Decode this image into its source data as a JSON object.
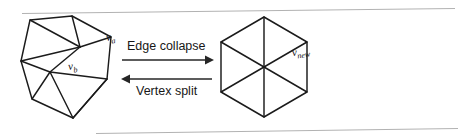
{
  "figure": {
    "background_color": "#ffffff",
    "stroke_color": "#1b1b1b",
    "rule_color": "#b2b2b2",
    "width": 472,
    "height": 137
  },
  "rules": {
    "top": {
      "x1": 22,
      "y1": 13.5,
      "x2": 455,
      "y2": 8.5
    },
    "bottom": {
      "x1": 96,
      "y1": 133.5,
      "x2": 458,
      "y2": 128.5
    }
  },
  "left_mesh": {
    "name": "pre-collapse-mesh",
    "caption_a": "v",
    "caption_a_sub": "a",
    "caption_b": "v",
    "caption_b_sub": "b",
    "label_a_position": {
      "x": 82,
      "y": 44
    },
    "label_b_position": {
      "x": 44,
      "y": 77
    },
    "boundary": "30,20 72,16 111,37 107,79 73,118 32,99 21,61",
    "edges": [
      "M 30,20 L 72,16",
      "M 72,16 L 111,37",
      "M 111,37 L 107,79",
      "M 107,79 L 73,118",
      "M 73,118 L 32,99",
      "M 32,99 L 21,61",
      "M 21,61 L 30,20",
      "M 30,20 L 80,47",
      "M 72,16 L 80,47",
      "M 111,37 L 80,47",
      "M 21,61 L 80,47",
      "M 21,61 L 50,72",
      "M 80,47 L 50,72",
      "M 107,79 L 50,72",
      "M 32,99 L 50,72",
      "M 73,118 L 50,72",
      "M 73,118 L 107,79",
      "M 107,79 L 111,37"
    ],
    "collapse_edge": "M 80,47 L 50,72"
  },
  "right_mesh": {
    "name": "post-collapse-mesh",
    "caption_new": "v",
    "caption_new_sub": "new",
    "label_new_position": {
      "x": 268,
      "y": 62
    },
    "center": {
      "x": 264,
      "y": 67
    },
    "vertices": "264,17 307,42 307,92 264,117 221,92 221,42",
    "edges": [
      "M 264,17 L 307,42",
      "M 307,42 L 307,92",
      "M 307,92 L 264,117",
      "M 264,117 L 221,92",
      "M 221,92 L 221,42",
      "M 221,42 L 264,17",
      "M 264,67 L 264,17",
      "M 264,67 L 307,42",
      "M 264,67 L 307,92",
      "M 264,67 L 264,117",
      "M 264,67 L 221,92",
      "M 264,67 L 221,42"
    ]
  },
  "arrows": {
    "forward": {
      "label": "Edge collapse",
      "label_position": {
        "x": 127,
        "y": 50
      },
      "line": {
        "x1": 122,
        "y1": 60,
        "x2": 210,
        "y2": 60
      },
      "direction": "right"
    },
    "backward": {
      "label": "Vertex split",
      "label_position": {
        "x": 136,
        "y": 94
      },
      "line": {
        "x1": 122,
        "y1": 79,
        "x2": 210,
        "y2": 79
      },
      "direction": "left"
    }
  }
}
